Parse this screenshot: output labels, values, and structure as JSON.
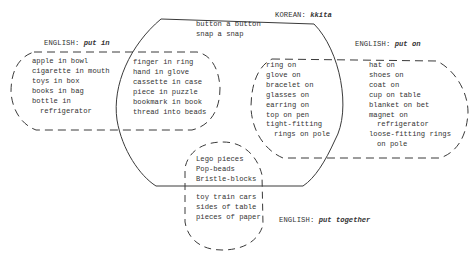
{
  "diagram": {
    "type": "venn-overlap",
    "colors": {
      "stroke": "#3a3a3a",
      "text": "#333333",
      "background": "#ffffff"
    },
    "categories": {
      "korean_kkita": {
        "language": "KOREAN:",
        "term": "kkita",
        "boundary": "solid",
        "exclusive_items": [
          "button a button",
          "snap a snap"
        ]
      },
      "english_put_in": {
        "language": "ENGLISH:",
        "term": "put in",
        "boundary": "dashed",
        "exclusive_items": [
          {
            "text": "apple in bowl"
          },
          {
            "text": "cigarette in mouth"
          },
          {
            "text": "toys in box"
          },
          {
            "text": "books in bag"
          },
          {
            "text": "bottle in"
          },
          {
            "text": "refrigerator",
            "indent": true
          }
        ],
        "overlap_with_kkita": [
          "finger in ring",
          "hand in glove",
          "cassette in case",
          "piece in puzzle",
          "bookmark in book",
          "thread into beads"
        ]
      },
      "english_put_on": {
        "language": "ENGLISH:",
        "term": "put on",
        "boundary": "dashed",
        "overlap_with_kkita": [
          {
            "text": "ring on"
          },
          {
            "text": "glove on"
          },
          {
            "text": "bracelet on"
          },
          {
            "text": "glasses on"
          },
          {
            "text": "earring on"
          },
          {
            "text": "top on pen"
          },
          {
            "text": "tight-fitting"
          },
          {
            "text": "rings on pole",
            "indent": true
          }
        ],
        "exclusive_items": [
          {
            "text": "hat on"
          },
          {
            "text": "shoes on"
          },
          {
            "text": "coat on"
          },
          {
            "text": "cup on table"
          },
          {
            "text": "blanket on bet"
          },
          {
            "text": "magnet on"
          },
          {
            "text": "refrigerator",
            "indent": true
          },
          {
            "text": "loose-fitting rings"
          },
          {
            "text": "on pole",
            "indent": true
          }
        ]
      },
      "english_put_together": {
        "language": "ENGLISH:",
        "term": "put together",
        "boundary": "dashed",
        "overlap_with_kkita": [
          "Lego pieces",
          "Pop-beads",
          "Bristle-blocks"
        ],
        "exclusive_items": [
          "toy train cars",
          "sides of table",
          "pieces of paper"
        ]
      }
    }
  }
}
